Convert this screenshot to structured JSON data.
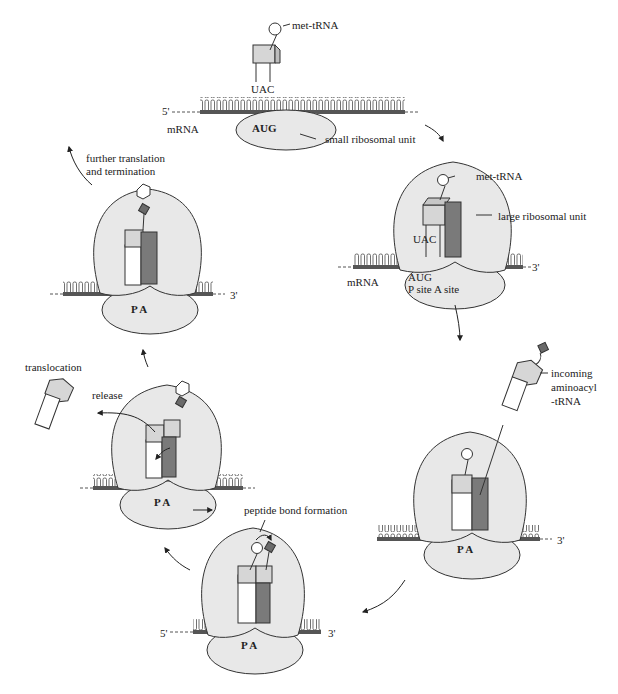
{
  "figure": {
    "colors": {
      "ribosome_fill": "#e8e8e8",
      "ribosome_stroke": "#333333",
      "trna_light": "#d6d6d6",
      "trna_dark": "#7a7a7a",
      "amino_acid_dark": "#6a6a6a",
      "mrna_strand": "#555555",
      "arrow": "#222222"
    },
    "panels": [
      {
        "id": "initiation",
        "labels": {
          "met_trna": "met-tRNA",
          "anticodon": "UAC",
          "five_prime": "5'",
          "mrna": "mRNA",
          "codon": "AUG",
          "small_unit": "small ribosomal unit"
        }
      },
      {
        "id": "assembly",
        "labels": {
          "met_trna": "met-tRNA",
          "large_unit": "large ribosomal unit",
          "anticodon": "UAC",
          "mrna": "mRNA",
          "codon": "AUG",
          "sites": "P site A site",
          "three_prime": "3'"
        }
      },
      {
        "id": "incoming",
        "labels": {
          "incoming_line1": "incoming",
          "incoming_line2": "aminoacyl",
          "incoming_line3": "-tRNA",
          "sites": "P  A",
          "three_prime": "3'"
        }
      },
      {
        "id": "peptide-bond",
        "labels": {
          "peptide_bond": "peptide bond formation",
          "five_prime": "5'",
          "three_prime": "3'",
          "sites": "P  A"
        }
      },
      {
        "id": "translocation",
        "labels": {
          "translocation": "translocation",
          "release": "release",
          "sites": "P  A"
        }
      },
      {
        "id": "termination",
        "labels": {
          "further_line1": "further translation",
          "further_line2": "and termination",
          "sites": "P  A",
          "three_prime": "3'"
        }
      }
    ]
  }
}
